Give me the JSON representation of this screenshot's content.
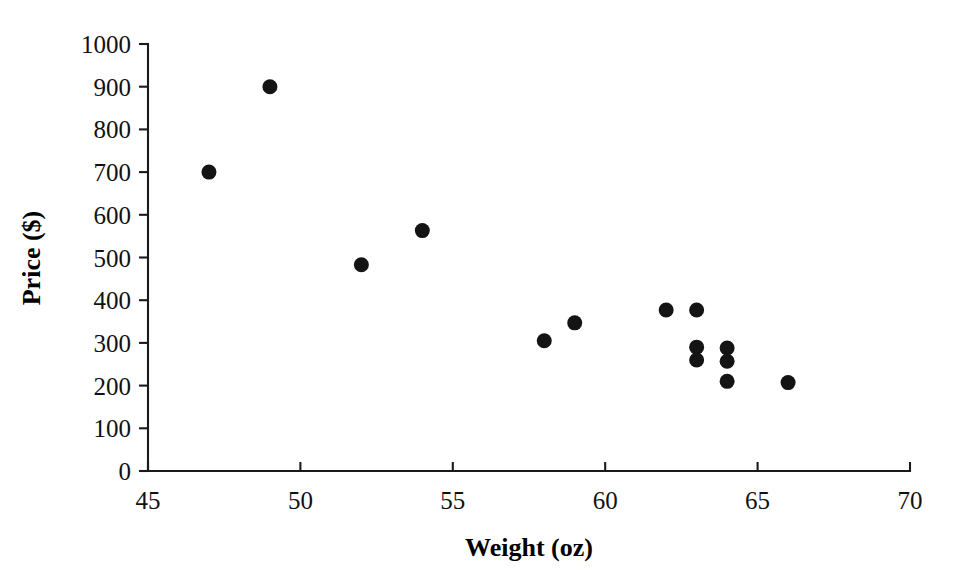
{
  "chart_data": {
    "type": "scatter",
    "title": "",
    "xlabel": "Weight (oz)",
    "ylabel": "Price ($)",
    "xlim": [
      45,
      70
    ],
    "ylim": [
      0,
      1000
    ],
    "xticks": [
      45,
      50,
      55,
      60,
      65,
      70
    ],
    "yticks": [
      0,
      100,
      200,
      300,
      400,
      500,
      600,
      700,
      800,
      900,
      1000
    ],
    "xtick_labels": [
      "45",
      "50",
      "55",
      "60",
      "65",
      "70"
    ],
    "ytick_labels": [
      "0",
      "100",
      "200",
      "300",
      "400",
      "500",
      "600",
      "700",
      "800",
      "900",
      "1000"
    ],
    "grid": false,
    "legend": null,
    "marker": "filled-circle",
    "marker_color": "#141414",
    "marker_size": 15,
    "series": [
      {
        "name": "observations",
        "points": [
          {
            "x": 47,
            "y": 700
          },
          {
            "x": 49,
            "y": 900
          },
          {
            "x": 52,
            "y": 483
          },
          {
            "x": 54,
            "y": 563
          },
          {
            "x": 58,
            "y": 305
          },
          {
            "x": 59,
            "y": 347
          },
          {
            "x": 62,
            "y": 377
          },
          {
            "x": 63,
            "y": 377
          },
          {
            "x": 63,
            "y": 290
          },
          {
            "x": 63,
            "y": 260
          },
          {
            "x": 64,
            "y": 288
          },
          {
            "x": 64,
            "y": 257
          },
          {
            "x": 64,
            "y": 210
          },
          {
            "x": 66,
            "y": 207
          }
        ]
      }
    ],
    "x": [
      47,
      49,
      52,
      54,
      58,
      59,
      62,
      63,
      63,
      63,
      64,
      64,
      64,
      66
    ],
    "values": [
      700,
      900,
      483,
      563,
      305,
      347,
      377,
      377,
      290,
      260,
      288,
      257,
      210,
      207
    ]
  },
  "axes": {
    "x_title": "Weight (oz)",
    "y_title": "Price ($)"
  },
  "colors": {
    "marker": "#141414",
    "axis": "#1a1a1a",
    "background": "#ffffff"
  }
}
